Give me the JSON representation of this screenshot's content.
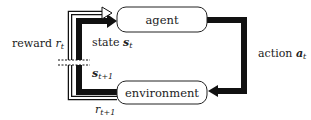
{
  "diagram": {
    "nodes": [
      {
        "id": "agent",
        "label": "agent"
      },
      {
        "id": "environment",
        "label": "environment"
      }
    ],
    "edges": [
      {
        "from": "agent",
        "to": "environment",
        "label": "action",
        "symbol": "a",
        "subscript": "t"
      },
      {
        "from": "environment",
        "to": "agent",
        "label": "state",
        "symbol": "s",
        "subscript": "t"
      },
      {
        "from": "environment",
        "to": "agent",
        "label": "reward",
        "symbol": "r",
        "subscript": "t"
      }
    ],
    "next_labels": {
      "state_next": {
        "symbol": "s",
        "subscript": "t+1"
      },
      "reward_next": {
        "symbol": "r",
        "subscript": "t+1"
      }
    },
    "colors": {
      "stroke": "#111111",
      "fill": "#ffffff",
      "text": "#222222"
    }
  }
}
